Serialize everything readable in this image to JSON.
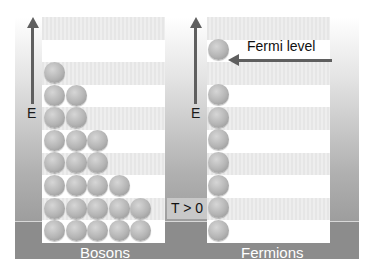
{
  "diagram": {
    "energy_axis_label": "E",
    "bosons": {
      "label": "Bosons",
      "rows_from_top": [
        1,
        2,
        2,
        3,
        3,
        4,
        5,
        5
      ]
    },
    "fermions": {
      "label": "Fermions",
      "occupied_levels_from_top": [
        true,
        false,
        true,
        true,
        true,
        true,
        true,
        true,
        true
      ],
      "fermi_level_label": "Fermi level",
      "temperature_label": "T > 0"
    },
    "colors": {
      "background_gradient_top": "#ffffff",
      "background_gradient_bottom": "#8f8f8f",
      "band_gray": "#e6e6e6",
      "ball": "#b4b4b4",
      "arrow": "#5f5f5f"
    }
  }
}
